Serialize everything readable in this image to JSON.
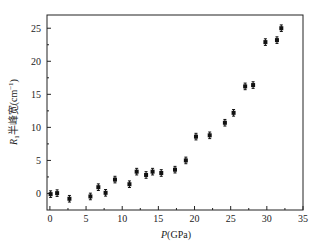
{
  "chart_data": {
    "type": "scatter",
    "title": "",
    "xlabel": "P(GPa)",
    "xlabel_italic": "P",
    "xlabel_rest": "(GPa)",
    "ylabel": "R1半峰宽(cm−1)",
    "ylabel_parts": {
      "italic": "R",
      "sub": "1",
      "text": "半峰宽(cm",
      "sup": "−1",
      "close": ")"
    },
    "xlim": [
      -0.4,
      35
    ],
    "ylim": [
      -2.5,
      27
    ],
    "xticks": [
      0,
      5,
      10,
      15,
      20,
      25,
      30,
      35
    ],
    "yticks": [
      0,
      5,
      10,
      15,
      20,
      25
    ],
    "grid": false,
    "legend": "none",
    "marker_color": "#111111",
    "error_bar": 0.5,
    "points": [
      {
        "x": 0.1,
        "y": -0.1
      },
      {
        "x": 1.0,
        "y": 0.05
      },
      {
        "x": 2.7,
        "y": -0.8
      },
      {
        "x": 5.6,
        "y": -0.45
      },
      {
        "x": 6.7,
        "y": 0.95
      },
      {
        "x": 7.7,
        "y": 0.1
      },
      {
        "x": 9.0,
        "y": 2.1
      },
      {
        "x": 11.0,
        "y": 1.4
      },
      {
        "x": 12.0,
        "y": 3.3
      },
      {
        "x": 13.3,
        "y": 2.8
      },
      {
        "x": 14.2,
        "y": 3.3
      },
      {
        "x": 15.4,
        "y": 3.1
      },
      {
        "x": 17.3,
        "y": 3.6
      },
      {
        "x": 18.8,
        "y": 5.0
      },
      {
        "x": 20.2,
        "y": 8.6
      },
      {
        "x": 22.1,
        "y": 8.8
      },
      {
        "x": 24.2,
        "y": 10.7
      },
      {
        "x": 25.4,
        "y": 12.2
      },
      {
        "x": 27.0,
        "y": 16.2
      },
      {
        "x": 28.1,
        "y": 16.4
      },
      {
        "x": 29.8,
        "y": 22.9
      },
      {
        "x": 31.4,
        "y": 23.2
      },
      {
        "x": 32.0,
        "y": 25.0
      }
    ]
  }
}
